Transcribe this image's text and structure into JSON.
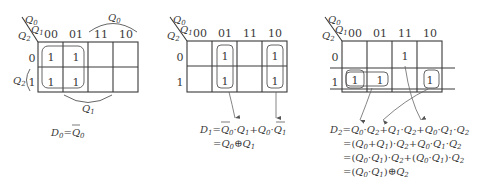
{
  "maps": [
    {
      "id": "map-d0",
      "row_var": "Q2",
      "col_vars": "Q0Q1",
      "col_labels": [
        "00",
        "01",
        "11",
        "10"
      ],
      "row_labels": [
        "0",
        "1"
      ],
      "cells": [
        [
          "1",
          "1",
          "",
          ""
        ],
        [
          "1",
          "1",
          "",
          ""
        ]
      ],
      "annotations": {
        "top_arc": "Q0",
        "left_bracket": "Q2",
        "bottom_arc": "Q1"
      },
      "equation": [
        "D0=Q̄0"
      ]
    },
    {
      "id": "map-d1",
      "row_var": "Q2",
      "col_vars": "Q0Q1",
      "col_labels": [
        "00",
        "01",
        "11",
        "10"
      ],
      "row_labels": [
        "0",
        "1"
      ],
      "cells": [
        [
          "",
          "1",
          "",
          "1"
        ],
        [
          "",
          "1",
          "",
          "1"
        ]
      ],
      "equation": [
        "D1=Q̄0·Q1+Q0·Q̄1",
        "=Q0⊕Q1"
      ]
    },
    {
      "id": "map-d2",
      "row_var": "Q2",
      "col_vars": "Q0Q1",
      "col_labels": [
        "00",
        "01",
        "11",
        "10"
      ],
      "row_labels": [
        "0",
        "1"
      ],
      "cells": [
        [
          "",
          "",
          "1",
          ""
        ],
        [
          "1",
          "1",
          "",
          "1"
        ]
      ],
      "equation": [
        "D2=Q̄0·Q2+Q̄1·Q2+Q0·Q1·Q̄2",
        "=(Q̄0+Q̄1)·Q2+Q0·Q1·Q̄2",
        "=(Q0·Q1)‾·Q2+(Q0·Q1)·Q̄2",
        "=(Q0·Q1)⊕Q2"
      ]
    }
  ],
  "labels": {
    "Q": "Q",
    "D": "D",
    "sub0": "0",
    "sub1": "1",
    "sub2": "2",
    "one": "1",
    "zero": "0",
    "c00": "00",
    "c01": "01",
    "c11": "11",
    "c10": "10",
    "eqsign": "=",
    "plus": "+",
    "dot": "·",
    "xor": "⊕",
    "lp": "(",
    "rp": ")"
  }
}
